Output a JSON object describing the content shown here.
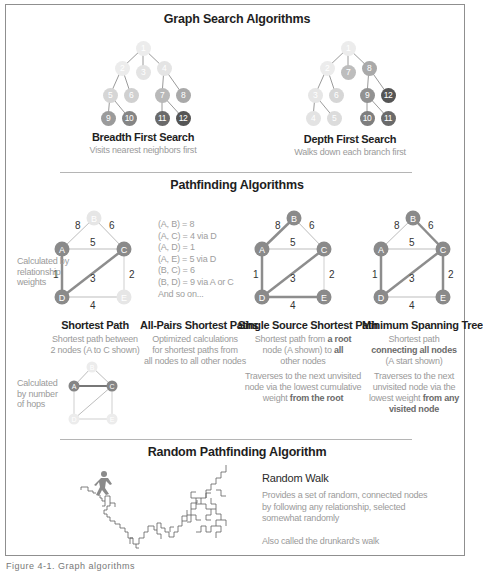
{
  "sections": {
    "graph_search": {
      "title": "Graph Search Algorithms",
      "bfs": {
        "title": "Breadth First Search",
        "subtitle": "Visits nearest neighbors first",
        "nodes": [
          {
            "id": "1",
            "label": "1",
            "x": 88,
            "y": 48,
            "shade": "#ececec"
          },
          {
            "id": "2",
            "label": "2",
            "x": 67,
            "y": 68,
            "shade": "#ececec"
          },
          {
            "id": "3",
            "label": "3",
            "x": 88,
            "y": 72,
            "shade": "#e4e4e4"
          },
          {
            "id": "4",
            "label": "4",
            "x": 109,
            "y": 68,
            "shade": "#e4e4e4"
          },
          {
            "id": "5",
            "label": "5",
            "x": 55,
            "y": 95,
            "shade": "#d6d6d6"
          },
          {
            "id": "6",
            "label": "6",
            "x": 76,
            "y": 95,
            "shade": "#d0d0d0"
          },
          {
            "id": "7",
            "label": "7",
            "x": 107,
            "y": 95,
            "shade": "#b9b9b9"
          },
          {
            "id": "8",
            "label": "8",
            "x": 128,
            "y": 95,
            "shade": "#a9a9a9"
          },
          {
            "id": "9",
            "label": "9",
            "x": 53,
            "y": 118,
            "shade": "#9b9b9b"
          },
          {
            "id": "10",
            "label": "10",
            "x": 74,
            "y": 118,
            "shade": "#858585"
          },
          {
            "id": "11",
            "label": "11",
            "x": 107,
            "y": 118,
            "shade": "#6a6a6a"
          },
          {
            "id": "12",
            "label": "12",
            "x": 128,
            "y": 118,
            "shade": "#555555"
          }
        ]
      },
      "dfs": {
        "title": "Depth First Search",
        "subtitle": "Walks down each branch first",
        "nodes": [
          {
            "id": "1",
            "label": "1",
            "x": 88,
            "y": 48,
            "shade": "#ececec"
          },
          {
            "id": "2",
            "label": "2",
            "x": 67,
            "y": 68,
            "shade": "#ececec"
          },
          {
            "id": "7",
            "label": "7",
            "x": 88,
            "y": 72,
            "shade": "#bdbdbd"
          },
          {
            "id": "8",
            "label": "8",
            "x": 109,
            "y": 68,
            "shade": "#a9a9a9"
          },
          {
            "id": "3",
            "label": "3",
            "x": 55,
            "y": 95,
            "shade": "#e6e6e6"
          },
          {
            "id": "6",
            "label": "6",
            "x": 76,
            "y": 95,
            "shade": "#d6d6d6"
          },
          {
            "id": "9",
            "label": "9",
            "x": 107,
            "y": 95,
            "shade": "#929292"
          },
          {
            "id": "12",
            "label": "12",
            "x": 128,
            "y": 95,
            "shade": "#555555"
          },
          {
            "id": "4",
            "label": "4",
            "x": 53,
            "y": 118,
            "shade": "#e3e3e3"
          },
          {
            "id": "5",
            "label": "5",
            "x": 74,
            "y": 118,
            "shade": "#dcdcdc"
          },
          {
            "id": "10",
            "label": "10",
            "x": 107,
            "y": 118,
            "shade": "#7e7e7e"
          },
          {
            "id": "11",
            "label": "11",
            "x": 128,
            "y": 118,
            "shade": "#6a6a6a"
          }
        ]
      }
    },
    "pathfinding": {
      "title": "Pathfinding Algorithms",
      "weights_note": "Calculated by relationship weights",
      "weights_note_lines": [
        "Calculated by",
        "relationship",
        "weights"
      ],
      "hops_note_lines": [
        "Calculated",
        "by number",
        "of hops"
      ],
      "edge_weights": {
        "AB": "8",
        "BC": "6",
        "AC": "5",
        "AD": "1",
        "DC": "3",
        "CE": "2",
        "DE": "4"
      },
      "node_labels": {
        "A": "A",
        "B": "B",
        "C": "C",
        "D": "D",
        "E": "E"
      },
      "all_pairs_list": [
        "(A, B) = 8",
        "(A, C) = 4 via D",
        "(A, D) = 1",
        "(A, E) = 5 via D",
        "(B, C) = 6",
        "(B, D) = 9 via A or C",
        "And so on..."
      ],
      "shortest_path": {
        "title": "Shortest Path",
        "subtitle_lines": [
          "Shortest path between",
          "2 nodes (A to C shown)"
        ]
      },
      "all_pairs": {
        "title": "All-Pairs Shortest Paths",
        "subtitle_lines": [
          "Optimized calculations",
          "for shortest paths from",
          "all nodes to all other nodes"
        ]
      },
      "single_source": {
        "title": "Single Source Shortest Path",
        "line1_a": "Shortest path from ",
        "line1_b": "a root",
        "line2_a": "node (A shown) to ",
        "line2_b": "all",
        "line3": "other nodes",
        "line4": "Traverses to the next unvisited",
        "line5": "node via the  lowest cumulative",
        "line6_a": "weight ",
        "line6_b": "from the root"
      },
      "mst": {
        "title": "Minimum Spanning Tree",
        "line1": "Shortest path",
        "line2": "connecting all nodes",
        "line3": "(A start shown)",
        "line4": "Traverses to the next",
        "line5": "unvisited node via the",
        "line6_a": "lowest weight ",
        "line6_b": "from any",
        "line7": "visited node"
      }
    },
    "random": {
      "title": "Random Pathfinding Algorithm",
      "rw_title": "Random Walk",
      "rw_lines": [
        "Provides a set of random, connected nodes",
        "by following any relationship, selected",
        "somewhat  randomly"
      ],
      "rw_note": "Also called the drunkard's walk"
    }
  },
  "bottom_caption": "Figure 4-1. Graph algorithms"
}
